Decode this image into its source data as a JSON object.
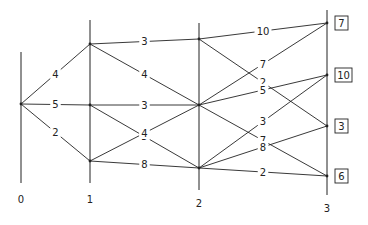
{
  "diagram": {
    "type": "multistage-network",
    "stages": [
      {
        "label": "0",
        "x": 21,
        "y_top": 52,
        "y_bottom": 183,
        "label_y": 199
      },
      {
        "label": "1",
        "x": 90,
        "y_top": 20,
        "y_bottom": 183,
        "label_y": 199
      },
      {
        "label": "2",
        "x": 199,
        "y_top": 23,
        "y_bottom": 190,
        "label_y": 203
      },
      {
        "label": "3",
        "x": 327,
        "y_top": 10,
        "y_bottom": 195,
        "label_y": 208
      }
    ],
    "nodes": [
      {
        "id": "s0",
        "stage": 0,
        "x": 21,
        "y": 104
      },
      {
        "id": "s1a",
        "stage": 1,
        "x": 90,
        "y": 44
      },
      {
        "id": "s1b",
        "stage": 1,
        "x": 90,
        "y": 105
      },
      {
        "id": "s1c",
        "stage": 1,
        "x": 90,
        "y": 161
      },
      {
        "id": "s2a",
        "stage": 2,
        "x": 199,
        "y": 39
      },
      {
        "id": "s2b",
        "stage": 2,
        "x": 199,
        "y": 105
      },
      {
        "id": "s2c",
        "stage": 2,
        "x": 199,
        "y": 168
      },
      {
        "id": "s3a",
        "stage": 3,
        "x": 327,
        "y": 23,
        "terminal_value": "7"
      },
      {
        "id": "s3b",
        "stage": 3,
        "x": 327,
        "y": 75,
        "terminal_value": "10"
      },
      {
        "id": "s3c",
        "stage": 3,
        "x": 327,
        "y": 126,
        "terminal_value": "3"
      },
      {
        "id": "s3d",
        "stage": 3,
        "x": 327,
        "y": 176,
        "terminal_value": "6"
      }
    ],
    "edges": [
      {
        "from": "s0",
        "to": "s1a",
        "label": "4"
      },
      {
        "from": "s0",
        "to": "s1b",
        "label": "5"
      },
      {
        "from": "s0",
        "to": "s1c",
        "label": "2"
      },
      {
        "from": "s1a",
        "to": "s2a",
        "label": "3"
      },
      {
        "from": "s1a",
        "to": "s2b",
        "label": "4"
      },
      {
        "from": "s1b",
        "to": "s2b",
        "label": "3"
      },
      {
        "from": "s1b",
        "to": "s2c",
        "label": "5"
      },
      {
        "from": "s1c",
        "to": "s2b",
        "label": "4"
      },
      {
        "from": "s1c",
        "to": "s2c",
        "label": "8"
      },
      {
        "from": "s2a",
        "to": "s3a",
        "label": "10"
      },
      {
        "from": "s2a",
        "to": "s3c",
        "label": "2"
      },
      {
        "from": "s2b",
        "to": "s3a",
        "label": "7"
      },
      {
        "from": "s2b",
        "to": "s3b",
        "label": "5"
      },
      {
        "from": "s2b",
        "to": "s3d",
        "label": "7"
      },
      {
        "from": "s2c",
        "to": "s3b",
        "label": "3"
      },
      {
        "from": "s2c",
        "to": "s3c",
        "label": "8"
      },
      {
        "from": "s2c",
        "to": "s3d",
        "label": "2"
      }
    ]
  }
}
